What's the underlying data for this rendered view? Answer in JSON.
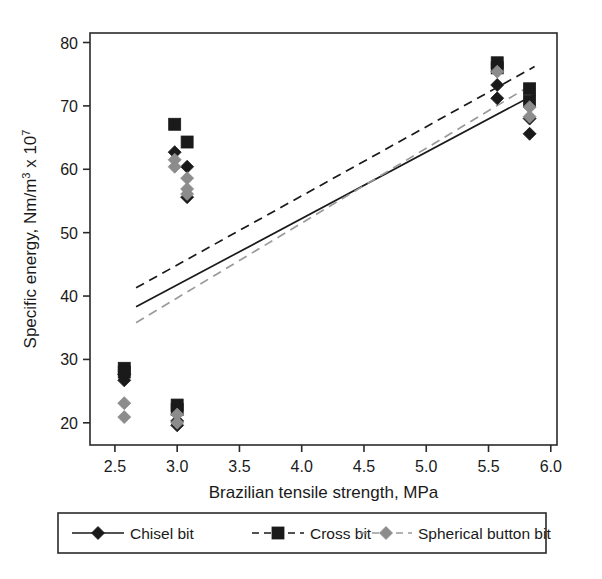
{
  "chart_data": {
    "type": "scatter",
    "title": "",
    "xlabel": "Brazilian tensile strength, MPa",
    "ylabel": "Specific energy, Nm/m",
    "ylabel_sup1": "3",
    "ylabel_mid": " x 10",
    "ylabel_sup2": "7",
    "ylabel_full": "Specific energy, Nm/m3 x 107",
    "xlim": [
      2.3,
      6.05
    ],
    "ylim": [
      16.5,
      81.5
    ],
    "xticks": [
      2.5,
      3.0,
      3.5,
      4.0,
      4.5,
      5.0,
      5.5,
      6.0
    ],
    "xtick_labels": [
      "2.5",
      "3.0",
      "3.5",
      "4.0",
      "4.5",
      "5.0",
      "5.5",
      "6.0"
    ],
    "yticks": [
      20,
      30,
      40,
      50,
      60,
      70,
      80
    ],
    "ytick_labels": [
      "20",
      "30",
      "40",
      "50",
      "60",
      "70",
      "80"
    ],
    "grid": false,
    "legend_position": "below-plot",
    "frame_color": "#2a2a2a",
    "series": [
      {
        "name": "Chisel bit",
        "marker": "diamond",
        "color": "#1a1a1a",
        "line_style": "solid",
        "line_color": "#1a1a1a",
        "points": [
          {
            "x": 2.575,
            "y": 27.6
          },
          {
            "x": 2.575,
            "y": 26.7
          },
          {
            "x": 2.98,
            "y": 62.7
          },
          {
            "x": 3.08,
            "y": 60.4
          },
          {
            "x": 3.08,
            "y": 55.6
          },
          {
            "x": 3.0,
            "y": 20.3
          },
          {
            "x": 3.0,
            "y": 19.6
          },
          {
            "x": 5.57,
            "y": 73.3
          },
          {
            "x": 5.57,
            "y": 71.2
          },
          {
            "x": 5.83,
            "y": 68.0
          },
          {
            "x": 5.83,
            "y": 65.6
          }
        ],
        "fit_line": {
          "x1": 2.67,
          "y1": 38.3,
          "x2": 5.87,
          "y2": 71.8
        }
      },
      {
        "name": "Cross bit",
        "marker": "square",
        "color": "#1a1a1a",
        "line_style": "dashed",
        "line_color": "#1a1a1a",
        "points": [
          {
            "x": 2.575,
            "y": 28.6
          },
          {
            "x": 2.575,
            "y": 28.0
          },
          {
            "x": 2.98,
            "y": 67.1
          },
          {
            "x": 3.08,
            "y": 64.3
          },
          {
            "x": 3.0,
            "y": 22.8
          },
          {
            "x": 3.0,
            "y": 22.1
          },
          {
            "x": 5.57,
            "y": 76.8
          },
          {
            "x": 5.57,
            "y": 76.0
          },
          {
            "x": 5.83,
            "y": 72.7
          },
          {
            "x": 5.83,
            "y": 70.7
          }
        ],
        "fit_line": {
          "x1": 2.67,
          "y1": 41.3,
          "x2": 5.87,
          "y2": 76.2
        }
      },
      {
        "name": "Spherical button bit",
        "marker": "diamond",
        "color": "#8c8c8c",
        "line_style": "dashed",
        "line_color": "#9a9a9a",
        "points": [
          {
            "x": 2.575,
            "y": 23.1
          },
          {
            "x": 2.575,
            "y": 20.9
          },
          {
            "x": 2.98,
            "y": 61.5
          },
          {
            "x": 2.98,
            "y": 60.4
          },
          {
            "x": 3.08,
            "y": 58.6
          },
          {
            "x": 3.08,
            "y": 56.9
          },
          {
            "x": 3.08,
            "y": 56.1
          },
          {
            "x": 3.0,
            "y": 21.3
          },
          {
            "x": 3.0,
            "y": 20.0
          },
          {
            "x": 5.57,
            "y": 75.4
          },
          {
            "x": 5.83,
            "y": 69.8
          },
          {
            "x": 5.83,
            "y": 68.3
          }
        ],
        "fit_line": {
          "x1": 2.67,
          "y1": 35.8,
          "x2": 5.87,
          "y2": 73.6
        }
      }
    ]
  },
  "legend": {
    "items": [
      {
        "label": "Chisel bit",
        "marker": "diamond-black",
        "line": "solid"
      },
      {
        "label": "Cross bit",
        "marker": "square-black",
        "line": "dashed"
      },
      {
        "label": "Spherical button bit",
        "marker": "diamond-gray",
        "line": "dashed"
      }
    ]
  }
}
